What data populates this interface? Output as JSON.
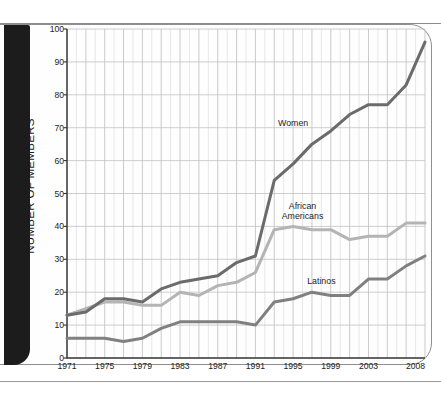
{
  "chart_data": {
    "type": "line",
    "title": "",
    "xlabel": "",
    "ylabel": "NUMBER OF MEMBERS",
    "xlim": [
      1971,
      2009
    ],
    "ylim": [
      0,
      100
    ],
    "grid": true,
    "legend_position": "inline-annotations",
    "ytick_labels": [
      "0",
      "10",
      "20",
      "30",
      "40",
      "50",
      "60",
      "70",
      "80",
      "90",
      "100"
    ],
    "ytick_values": [
      0,
      10,
      20,
      30,
      40,
      50,
      60,
      70,
      80,
      90,
      100
    ],
    "xtick_labels": [
      "1971",
      "1975",
      "1979",
      "1983",
      "1987",
      "1991",
      "1995",
      "1999",
      "2003",
      "2008"
    ],
    "xtick_values": [
      1971,
      1975,
      1979,
      1983,
      1987,
      1991,
      1995,
      1999,
      2003,
      2008
    ],
    "x": [
      1971,
      1973,
      1975,
      1977,
      1979,
      1981,
      1983,
      1985,
      1987,
      1989,
      1991,
      1993,
      1995,
      1997,
      1999,
      2001,
      2003,
      2005,
      2007,
      2009
    ],
    "series": [
      {
        "name": "Women",
        "color": "#6b6b6b",
        "values": [
          13,
          14,
          18,
          18,
          17,
          21,
          23,
          24,
          25,
          29,
          31,
          54,
          59,
          65,
          69,
          74,
          77,
          77,
          83,
          96
        ]
      },
      {
        "name": "African Americans",
        "color": "#b4b4b4",
        "values": [
          13,
          15,
          17,
          17,
          16,
          16,
          20,
          19,
          22,
          23,
          26,
          39,
          40,
          39,
          39,
          36,
          37,
          37,
          41,
          41
        ]
      },
      {
        "name": "Latinos",
        "color": "#808080",
        "values": [
          6,
          6,
          6,
          5,
          6,
          9,
          11,
          11,
          11,
          11,
          10,
          17,
          18,
          20,
          19,
          19,
          24,
          24,
          28,
          31
        ]
      }
    ]
  },
  "annotations": [
    {
      "label": "Women",
      "value_x": 1995,
      "value_y": 71
    },
    {
      "label": "African\nAmericans",
      "value_x": 1996,
      "value_y": 46
    },
    {
      "label": "Latinos",
      "value_x": 1998,
      "value_y": 23
    }
  ],
  "colors": {
    "women": "#6b6b6b",
    "african_americans": "#b4b4b4",
    "latinos": "#808080",
    "grid_minor": "#d8d8d8",
    "grid_major": "#c2c2c2",
    "axis": "#333333",
    "page_border": "#8f8f8f",
    "edge_bar": "#1c1c1c"
  }
}
